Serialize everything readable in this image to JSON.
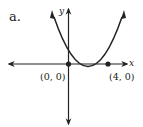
{
  "problem_label": "a.",
  "axes": {
    "x_label": "x",
    "y_label": "y"
  },
  "points": [
    {
      "label": "(0, 0)",
      "x": 0,
      "y": 0
    },
    {
      "label": "(4, 0)",
      "x": 4,
      "y": 0
    }
  ],
  "curve": {
    "type": "parabola",
    "equation": "y = x(x - 4)",
    "vertex": [
      2,
      -4
    ],
    "opens": "up"
  },
  "colors": {
    "ink": "#222222",
    "background": "#ffffff"
  }
}
